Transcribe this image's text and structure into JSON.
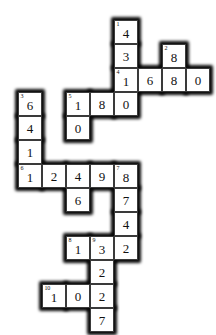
{
  "puzzle": {
    "kind": "numeric-crossword-grid",
    "grid": {
      "cell_size": 24,
      "origin_x": 18,
      "origin_y": 20,
      "columns": 8,
      "rows": 13
    },
    "colors": {
      "cell_background": "#ffffff",
      "cell_border": "#3a3a3a",
      "outline": "#0a0a0a",
      "text": "#111111",
      "page_background": "#ffffff"
    },
    "cells": [
      {
        "row": 0,
        "col": 4,
        "value": "4",
        "clue": "1"
      },
      {
        "row": 1,
        "col": 4,
        "value": "3",
        "clue": ""
      },
      {
        "row": 1,
        "col": 6,
        "value": "8",
        "clue": "2"
      },
      {
        "row": 2,
        "col": 4,
        "value": "1",
        "clue": "4"
      },
      {
        "row": 2,
        "col": 5,
        "value": "6",
        "clue": ""
      },
      {
        "row": 2,
        "col": 6,
        "value": "8",
        "clue": ""
      },
      {
        "row": 2,
        "col": 7,
        "value": "0",
        "clue": ""
      },
      {
        "row": 3,
        "col": 0,
        "value": "6",
        "clue": "3"
      },
      {
        "row": 3,
        "col": 2,
        "value": "1",
        "clue": "5"
      },
      {
        "row": 3,
        "col": 3,
        "value": "8",
        "clue": ""
      },
      {
        "row": 3,
        "col": 4,
        "value": "0",
        "clue": ""
      },
      {
        "row": 4,
        "col": 0,
        "value": "4",
        "clue": ""
      },
      {
        "row": 4,
        "col": 2,
        "value": "0",
        "clue": ""
      },
      {
        "row": 5,
        "col": 0,
        "value": "1",
        "clue": ""
      },
      {
        "row": 6,
        "col": 0,
        "value": "1",
        "clue": "6"
      },
      {
        "row": 6,
        "col": 1,
        "value": "2",
        "clue": ""
      },
      {
        "row": 6,
        "col": 2,
        "value": "4",
        "clue": ""
      },
      {
        "row": 6,
        "col": 3,
        "value": "9",
        "clue": ""
      },
      {
        "row": 6,
        "col": 4,
        "value": "8",
        "clue": "7"
      },
      {
        "row": 7,
        "col": 2,
        "value": "6",
        "clue": ""
      },
      {
        "row": 7,
        "col": 4,
        "value": "7",
        "clue": ""
      },
      {
        "row": 8,
        "col": 4,
        "value": "4",
        "clue": ""
      },
      {
        "row": 9,
        "col": 2,
        "value": "1",
        "clue": "8"
      },
      {
        "row": 9,
        "col": 3,
        "value": "3",
        "clue": "9"
      },
      {
        "row": 9,
        "col": 4,
        "value": "2",
        "clue": ""
      },
      {
        "row": 10,
        "col": 3,
        "value": "2",
        "clue": ""
      },
      {
        "row": 11,
        "col": 1,
        "value": "1",
        "clue": "10"
      },
      {
        "row": 11,
        "col": 2,
        "value": "0",
        "clue": ""
      },
      {
        "row": 11,
        "col": 3,
        "value": "2",
        "clue": ""
      },
      {
        "row": 12,
        "col": 3,
        "value": "7",
        "clue": ""
      }
    ]
  }
}
